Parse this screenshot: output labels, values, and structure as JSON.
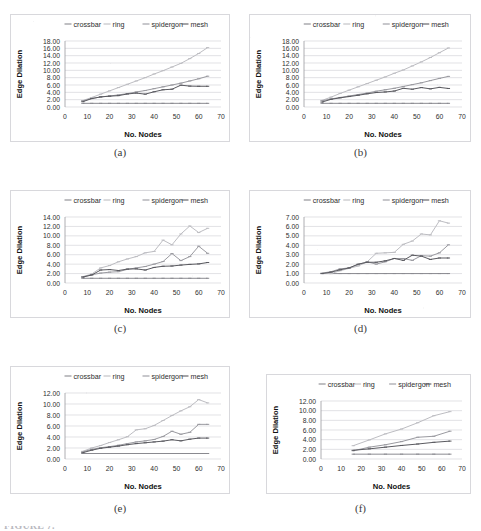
{
  "figure": {
    "caption_partial": "FIGURE 7.",
    "legend_labels": [
      "crossbar",
      "ring",
      "spidergon",
      "mesh"
    ],
    "xlabel": "No. Nodes",
    "ylabel": "Edge Dilation",
    "series_styles": {
      "crossbar": "#8a8a90",
      "ring": "#bdbdc2",
      "spidergon": "#9a9aa0",
      "mesh": "#5a5a60"
    }
  },
  "chart_data": [
    {
      "panel": "(a)",
      "type": "line",
      "xlabel": "No. Nodes",
      "ylabel": "Edge Dilation",
      "xlim": [
        0,
        70
      ],
      "ylim": [
        0,
        18
      ],
      "xticks": [
        0,
        10,
        20,
        30,
        40,
        50,
        60,
        70
      ],
      "yticks": [
        "0.00",
        "2.00",
        "4.00",
        "6.00",
        "8.00",
        "10.00",
        "12.00",
        "14.00",
        "16.00",
        "18.00"
      ],
      "grid": true,
      "legend": "top",
      "x": [
        8,
        12,
        16,
        20,
        24,
        28,
        32,
        36,
        40,
        44,
        48,
        52,
        56,
        60,
        64
      ],
      "series": [
        {
          "name": "crossbar",
          "values": [
            1.0,
            1.0,
            1.0,
            1.0,
            1.0,
            1.0,
            1.0,
            1.0,
            1.0,
            1.0,
            1.0,
            1.0,
            1.0,
            1.0,
            1.0
          ]
        },
        {
          "name": "ring",
          "values": [
            1.75,
            2.6,
            3.5,
            4.4,
            5.3,
            6.2,
            7.1,
            8.0,
            9.0,
            9.9,
            10.9,
            11.9,
            13.2,
            14.6,
            16.2
          ]
        },
        {
          "name": "spidergon",
          "values": [
            1.7,
            2.3,
            2.75,
            3.0,
            3.3,
            3.65,
            4.1,
            4.5,
            5.0,
            5.5,
            6.0,
            6.5,
            7.1,
            7.7,
            8.4
          ]
        },
        {
          "name": "mesh",
          "values": [
            1.45,
            2.3,
            2.75,
            2.95,
            3.1,
            3.55,
            3.8,
            3.5,
            4.15,
            4.7,
            4.85,
            5.95,
            5.7,
            5.65,
            5.65
          ]
        }
      ]
    },
    {
      "panel": "(b)",
      "type": "line",
      "xlabel": "No. Nodes",
      "ylabel": "Edge Dilation",
      "xlim": [
        0,
        70
      ],
      "ylim": [
        0,
        18
      ],
      "xticks": [
        0,
        10,
        20,
        30,
        40,
        50,
        60,
        70
      ],
      "yticks": [
        "0.00",
        "2.00",
        "4.00",
        "6.00",
        "8.00",
        "10.00",
        "12.00",
        "14.00",
        "16.00",
        "18.00"
      ],
      "grid": true,
      "legend": "top",
      "x": [
        8,
        12,
        16,
        20,
        24,
        28,
        32,
        36,
        40,
        44,
        48,
        52,
        56,
        60,
        64
      ],
      "series": [
        {
          "name": "crossbar",
          "values": [
            1.0,
            1.0,
            1.0,
            1.0,
            1.0,
            1.0,
            1.0,
            1.0,
            1.0,
            1.0,
            1.0,
            1.0,
            1.0,
            1.0,
            1.0
          ]
        },
        {
          "name": "ring",
          "values": [
            1.8,
            2.7,
            3.7,
            4.6,
            5.5,
            6.4,
            7.3,
            8.2,
            9.2,
            10.1,
            11.2,
            12.3,
            13.5,
            14.8,
            16.1
          ]
        },
        {
          "name": "spidergon",
          "values": [
            1.7,
            2.2,
            2.6,
            3.0,
            3.4,
            3.8,
            4.3,
            4.7,
            5.1,
            5.6,
            6.1,
            6.6,
            7.2,
            7.8,
            8.35
          ]
        },
        {
          "name": "mesh",
          "values": [
            1.35,
            2.1,
            2.5,
            2.85,
            3.2,
            3.6,
            3.95,
            4.1,
            4.35,
            5.1,
            4.85,
            5.3,
            4.95,
            5.35,
            5.05
          ]
        }
      ]
    },
    {
      "panel": "(c)",
      "type": "line",
      "xlabel": "No. Nodes",
      "ylabel": "Edge Dilation",
      "xlim": [
        0,
        70
      ],
      "ylim": [
        0,
        14
      ],
      "xticks": [
        0,
        10,
        20,
        30,
        40,
        50,
        60,
        70
      ],
      "yticks": [
        "0.00",
        "2.00",
        "4.00",
        "6.00",
        "8.00",
        "10.00",
        "12.00",
        "14.00"
      ],
      "grid": true,
      "legend": "top",
      "x": [
        8,
        12,
        16,
        20,
        24,
        28,
        32,
        36,
        40,
        44,
        48,
        52,
        56,
        60,
        64
      ],
      "series": [
        {
          "name": "crossbar",
          "values": [
            1.0,
            1.0,
            1.0,
            1.0,
            1.0,
            1.0,
            1.0,
            1.0,
            1.0,
            1.0,
            1.0,
            1.0,
            1.0,
            1.0,
            1.0
          ]
        },
        {
          "name": "ring",
          "values": [
            1.35,
            1.9,
            3.2,
            3.7,
            4.5,
            5.1,
            5.6,
            6.4,
            6.7,
            9.1,
            8.1,
            10.4,
            12.1,
            10.7,
            11.6
          ]
        },
        {
          "name": "spidergon",
          "values": [
            1.3,
            1.75,
            2.1,
            2.3,
            2.4,
            2.9,
            3.2,
            3.5,
            4.0,
            4.55,
            6.25,
            4.75,
            5.6,
            7.8,
            6.3
          ]
        },
        {
          "name": "mesh",
          "values": [
            1.25,
            1.7,
            2.75,
            2.85,
            2.65,
            2.95,
            3.0,
            2.75,
            3.3,
            3.55,
            3.6,
            3.8,
            3.95,
            4.05,
            4.35
          ]
        }
      ]
    },
    {
      "panel": "(d)",
      "type": "line",
      "xlabel": "No. Nodes",
      "ylabel": "Edge Dilation",
      "xlim": [
        0,
        70
      ],
      "ylim": [
        0,
        7
      ],
      "xticks": [
        0,
        10,
        20,
        30,
        40,
        50,
        60,
        70
      ],
      "yticks": [
        "0.00",
        "1.00",
        "2.00",
        "3.00",
        "4.00",
        "5.00",
        "6.00",
        "7.00"
      ],
      "grid": true,
      "legend": "top",
      "x": [
        8,
        12,
        16,
        20,
        24,
        28,
        32,
        36,
        40,
        44,
        48,
        52,
        56,
        60,
        64
      ],
      "series": [
        {
          "name": "crossbar",
          "values": [
            1.0,
            1.0,
            1.0,
            1.0,
            1.0,
            1.0,
            1.0,
            1.0,
            1.0,
            1.0,
            1.0,
            1.0,
            1.0,
            1.0,
            1.0
          ]
        },
        {
          "name": "ring",
          "values": [
            1.0,
            1.0,
            1.3,
            1.55,
            1.8,
            2.25,
            3.15,
            3.2,
            3.25,
            4.1,
            4.45,
            5.2,
            5.1,
            6.6,
            6.35
          ]
        },
        {
          "name": "spidergon",
          "values": [
            1.05,
            1.2,
            1.5,
            1.6,
            1.95,
            2.25,
            2.0,
            2.25,
            2.6,
            2.6,
            2.4,
            2.9,
            2.85,
            3.2,
            4.05
          ]
        },
        {
          "name": "mesh",
          "values": [
            1.0,
            1.15,
            1.4,
            1.6,
            2.0,
            2.2,
            2.2,
            2.35,
            2.6,
            2.4,
            2.95,
            2.85,
            2.5,
            2.65,
            2.65
          ]
        }
      ]
    },
    {
      "panel": "(e)",
      "type": "line",
      "xlabel": "No. Nodes",
      "ylabel": "Edge Dilation",
      "xlim": [
        0,
        70
      ],
      "ylim": [
        0,
        12
      ],
      "xticks": [
        0,
        10,
        20,
        30,
        40,
        50,
        60,
        70
      ],
      "yticks": [
        "0.00",
        "2.00",
        "4.00",
        "6.00",
        "8.00",
        "10.00",
        "12.00"
      ],
      "grid": true,
      "legend": "top",
      "x": [
        8,
        12,
        16,
        20,
        24,
        28,
        32,
        36,
        40,
        44,
        48,
        52,
        56,
        60,
        64
      ],
      "series": [
        {
          "name": "crossbar",
          "values": [
            1.0,
            1.0,
            1.0,
            1.0,
            1.0,
            1.0,
            1.0,
            1.0,
            1.0,
            1.0,
            1.0,
            1.0,
            1.0,
            1.0,
            1.0
          ]
        },
        {
          "name": "ring",
          "values": [
            1.4,
            2.0,
            2.45,
            3.0,
            3.5,
            4.05,
            5.3,
            5.5,
            6.1,
            7.0,
            7.9,
            8.75,
            9.5,
            10.8,
            10.2
          ]
        },
        {
          "name": "spidergon",
          "values": [
            1.3,
            1.75,
            2.05,
            2.25,
            2.5,
            2.8,
            3.1,
            3.3,
            3.55,
            4.1,
            5.05,
            4.5,
            4.85,
            6.3,
            6.3
          ]
        },
        {
          "name": "mesh",
          "values": [
            1.15,
            1.6,
            1.95,
            2.15,
            2.35,
            2.6,
            2.8,
            2.95,
            3.1,
            3.25,
            3.5,
            3.3,
            3.6,
            3.8,
            3.8
          ]
        }
      ]
    },
    {
      "panel": "(f)",
      "type": "line",
      "xlabel": "No. Nodes",
      "ylabel": "Edge Dilation",
      "xlim": [
        0,
        70
      ],
      "ylim": [
        0,
        12
      ],
      "xticks": [
        0,
        10,
        20,
        30,
        40,
        50,
        60,
        70
      ],
      "yticks": [
        "0.00",
        "2.00",
        "4.00",
        "6.00",
        "8.00",
        "10.00",
        "12.00"
      ],
      "grid": true,
      "legend": "top",
      "x": [
        16,
        24,
        32,
        40,
        48,
        56,
        64
      ],
      "series": [
        {
          "name": "crossbar",
          "values": [
            1.0,
            1.0,
            1.0,
            1.0,
            1.0,
            1.0,
            1.0
          ]
        },
        {
          "name": "ring",
          "values": [
            2.75,
            3.95,
            5.2,
            6.2,
            7.5,
            8.95,
            9.8
          ]
        },
        {
          "name": "spidergon",
          "values": [
            1.7,
            2.45,
            2.95,
            3.6,
            4.5,
            4.7,
            5.75
          ]
        },
        {
          "name": "mesh",
          "values": [
            1.8,
            2.1,
            2.45,
            2.8,
            3.1,
            3.45,
            3.7
          ]
        }
      ]
    }
  ]
}
